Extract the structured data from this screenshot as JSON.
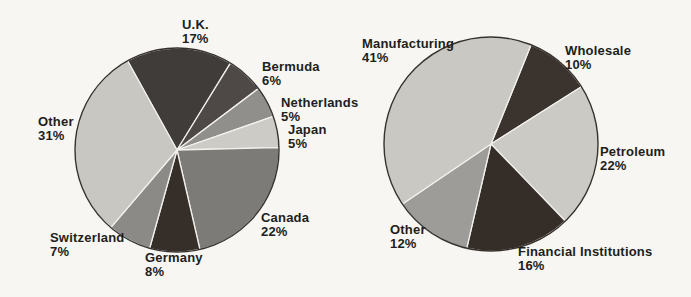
{
  "background_color": "#f7f6f2",
  "text_color": "#211e1c",
  "chart_data": [
    {
      "name": "pie-by-country",
      "type": "pie",
      "title": "",
      "legend": "none",
      "start_angle_deg": -29,
      "stroke_color": "#f2f1ed",
      "rim_color": "#36312c",
      "categories": [
        "U.K.",
        "Bermuda",
        "Netherlands",
        "Japan",
        "Canada",
        "Germany",
        "Switzerland",
        "Other"
      ],
      "values": [
        17,
        6,
        5,
        5,
        22,
        8,
        7,
        31
      ],
      "slices": [
        {
          "label": "U.K.",
          "pct_label": "17%",
          "value": 17,
          "color": "#403c3a"
        },
        {
          "label": "Bermuda",
          "pct_label": "6%",
          "value": 6,
          "color": "#4e4946"
        },
        {
          "label": "Netherlands",
          "pct_label": "5%",
          "value": 5,
          "color": "#908f8c"
        },
        {
          "label": "Japan",
          "pct_label": "5%",
          "value": 5,
          "color": "#cccbc6"
        },
        {
          "label": "Canada",
          "pct_label": "22%",
          "value": 22,
          "color": "#7c7b78"
        },
        {
          "label": "Germany",
          "pct_label": "8%",
          "value": 8,
          "color": "#362e29"
        },
        {
          "label": "Switzerland",
          "pct_label": "7%",
          "value": 7,
          "color": "#8b8a87"
        },
        {
          "label": "Other",
          "pct_label": "31%",
          "value": 31,
          "color": "#c8c7c2"
        }
      ]
    },
    {
      "name": "pie-by-industry",
      "type": "pie",
      "title": "",
      "legend": "none",
      "start_angle_deg": 22,
      "stroke_color": "#f2f1ed",
      "rim_color": "#36312c",
      "categories": [
        "Wholesale",
        "Petroleum",
        "Financial Institutions",
        "Other",
        "Manufacturing"
      ],
      "values": [
        10,
        22,
        16,
        12,
        41
      ],
      "slices": [
        {
          "label": "Wholesale",
          "pct_label": "10%",
          "value": 10,
          "color": "#3b332d"
        },
        {
          "label": "Petroleum",
          "pct_label": "22%",
          "value": 22,
          "color": "#cbcac5"
        },
        {
          "label": "Financial Institutions",
          "pct_label": "16%",
          "value": 16,
          "color": "#352d27"
        },
        {
          "label": "Other",
          "pct_label": "12%",
          "value": 12,
          "color": "#9d9c99"
        },
        {
          "label": "Manufacturing",
          "pct_label": "41%",
          "value": 41,
          "color": "#c9c8c3"
        }
      ]
    }
  ]
}
